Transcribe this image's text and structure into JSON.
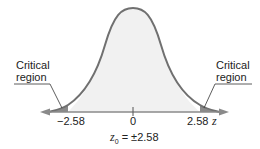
{
  "diagram": {
    "type": "normal-distribution-two-tailed",
    "labels": {
      "left_critical": [
        "Critical",
        "region"
      ],
      "right_critical": [
        "Critical",
        "region"
      ]
    },
    "ticks": {
      "left": "−2.58",
      "center": "0",
      "right": "2.58"
    },
    "axis_variable": "z",
    "equation": {
      "lhs": "z",
      "subscript": "0",
      "rhs": "= ±2.58"
    },
    "colors": {
      "curve": "#707070",
      "fill": "#f1f1f1",
      "critical_fill": "#8a8a8a",
      "axis": "#8a8a8a"
    }
  }
}
